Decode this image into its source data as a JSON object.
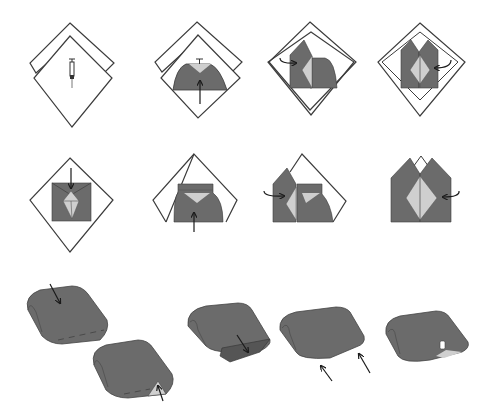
{
  "diagram": {
    "colors": {
      "paper_outline": "#3c3c3c",
      "paper_fill": "#ffffff",
      "fold_dark": "#6b6b6b",
      "fold_light": "#cfcfcf",
      "arrow": "#1a1a1a",
      "dash": "#4a4a4a"
    },
    "steps": [
      {
        "id": 1,
        "name": "step-1-two-squares-with-syringe",
        "icon": "syringe-icon"
      },
      {
        "id": 2,
        "name": "step-2-fold-bottom-up",
        "arrow": "up"
      },
      {
        "id": 3,
        "name": "step-3-fold-left-in",
        "arrow": "curve-right"
      },
      {
        "id": 4,
        "name": "step-4-fold-right-in",
        "arrow": "curve-left"
      },
      {
        "id": 5,
        "name": "step-5-fold-top-down",
        "arrow": "down"
      },
      {
        "id": 6,
        "name": "step-6-fold-bottom-up",
        "arrow": "up"
      },
      {
        "id": 7,
        "name": "step-7-fold-left-in",
        "arrow": "curve-right"
      },
      {
        "id": 8,
        "name": "step-8-fold-right-in",
        "arrow": "curve-left"
      },
      {
        "id": 9,
        "name": "step-9-rolled-press-down",
        "arrow": "down"
      },
      {
        "id": 10,
        "name": "step-10-rolled-tuck-corner",
        "arrow": "up"
      },
      {
        "id": 11,
        "name": "step-11-rolled-fold-flap",
        "arrow": "down"
      },
      {
        "id": 12,
        "name": "step-12-rolled-tuck-sides",
        "arrow": "up-left-pair"
      },
      {
        "id": 13,
        "name": "step-13-rolled-finished"
      }
    ]
  }
}
